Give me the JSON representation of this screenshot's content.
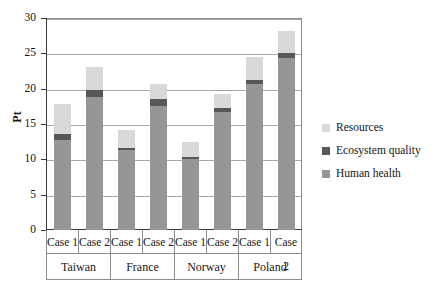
{
  "chart_data": {
    "type": "bar",
    "stacked": true,
    "title": "",
    "xlabel": "",
    "ylabel": "Pt",
    "ylim": [
      0,
      30
    ],
    "yticks": [
      0,
      5,
      10,
      15,
      20,
      25,
      30
    ],
    "ytick_labels": [
      "0",
      "5",
      "10",
      "15",
      "20",
      "25",
      "30"
    ],
    "grid": true,
    "legend_position": "right",
    "groups": [
      "Taiwan",
      "France",
      "Norway",
      "Poland"
    ],
    "subcategories": [
      "Case 1",
      "Case 2"
    ],
    "categories": [
      "Taiwan Case 1",
      "Taiwan Case 2",
      "France Case 1",
      "France Case 2",
      "Norway Case 1",
      "Norway Case 2",
      "Poland Case 1",
      "Poland Case 2"
    ],
    "series": [
      {
        "name": "Human health",
        "color": "#969696",
        "values": [
          12.8,
          18.8,
          11.3,
          17.6,
          10.1,
          16.7,
          20.6,
          24.3
        ]
      },
      {
        "name": "Ecosystem quality",
        "color": "#575757",
        "values": [
          0.8,
          1.0,
          0.3,
          1.0,
          0.2,
          0.5,
          0.6,
          0.8
        ]
      },
      {
        "name": "Resources",
        "color": "#d9d9d9",
        "values": [
          4.2,
          3.2,
          2.6,
          2.0,
          2.2,
          2.0,
          3.3,
          3.1
        ]
      }
    ],
    "totals": [
      17.8,
      23.0,
      14.2,
      20.6,
      12.5,
      19.2,
      24.5,
      28.2
    ]
  },
  "legend": {
    "items": [
      {
        "label": "Resources",
        "color": "#d9d9d9"
      },
      {
        "label": "Ecosystem quality",
        "color": "#575757"
      },
      {
        "label": "Human health",
        "color": "#969696"
      }
    ]
  },
  "axis": {
    "y_label": "Pt"
  }
}
